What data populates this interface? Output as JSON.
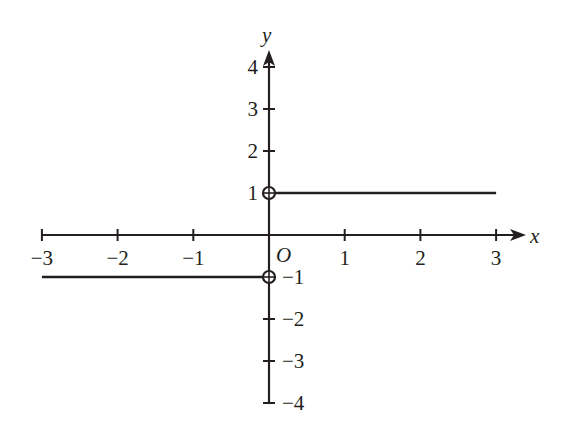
{
  "chart_data": {
    "type": "line",
    "title": "",
    "xlabel": "x",
    "ylabel": "y",
    "origin_label": "O",
    "xlim": [
      -3,
      3
    ],
    "ylim": [
      -4,
      4
    ],
    "grid": false,
    "legend": null,
    "x_ticks": [
      -3,
      -2,
      -1,
      1,
      2,
      3
    ],
    "x_tick_labels": [
      "−3",
      "−2",
      "−1",
      "1",
      "2",
      "3"
    ],
    "y_ticks": [
      4,
      3,
      2,
      1,
      -1,
      -2,
      -3,
      -4
    ],
    "y_tick_labels": [
      "4",
      "3",
      "2",
      "1",
      "−1",
      "−2",
      "−3",
      "−4"
    ],
    "series": [
      {
        "name": "y = -1 (x < 0)",
        "x": [
          -3,
          0
        ],
        "y": [
          -1,
          -1
        ],
        "right_endpoint": "open"
      },
      {
        "name": "y = 1 (x > 0)",
        "x": [
          0,
          3
        ],
        "y": [
          1,
          1
        ],
        "left_endpoint": "open"
      }
    ],
    "open_points": [
      {
        "x": 0,
        "y": 1
      },
      {
        "x": 0,
        "y": -1
      }
    ],
    "x_axis_arrow": "right",
    "y_axis_arrow": "up"
  },
  "colors": {
    "ink": "#231f20",
    "background": "#ffffff"
  }
}
